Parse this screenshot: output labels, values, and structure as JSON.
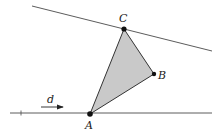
{
  "diagram": {
    "colors": {
      "line": "#4a4a4a",
      "triangle_fill": "#c9c9c9",
      "triangle_stroke": "#333333",
      "point": "#111111",
      "background": "#ffffff"
    },
    "points": {
      "A": {
        "label": "A",
        "x": 90,
        "y": 114
      },
      "B": {
        "label": "B",
        "x": 154,
        "y": 74
      },
      "C": {
        "label": "C",
        "x": 124,
        "y": 29
      }
    },
    "lines": {
      "top": {
        "x1": 32,
        "y1": 6,
        "x2": 212,
        "y2": 51
      },
      "bottom": {
        "x1": 10,
        "y1": 113,
        "x2": 212,
        "y2": 113
      }
    },
    "direction_arrow": {
      "label": "d",
      "x1": 41,
      "y1": 107,
      "x2": 64,
      "y2": 107
    }
  }
}
